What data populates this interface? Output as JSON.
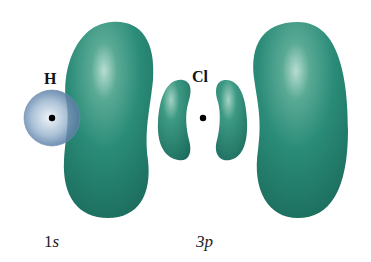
{
  "figure": {
    "atoms": [
      {
        "symbol": "H",
        "orbital_number": "1",
        "orbital_letter": "s"
      },
      {
        "symbol": "Cl",
        "orbital_number": "3",
        "orbital_letter": "p"
      }
    ],
    "colors": {
      "p_lobe": "#2a8c78",
      "p_lobe_dark": "#1f7463",
      "p_lobe_highlight": "#a9d4c7",
      "s_sphere": "#7d9fc0",
      "s_sphere_highlight": "#e6eef6",
      "nucleus": "#000000"
    }
  }
}
